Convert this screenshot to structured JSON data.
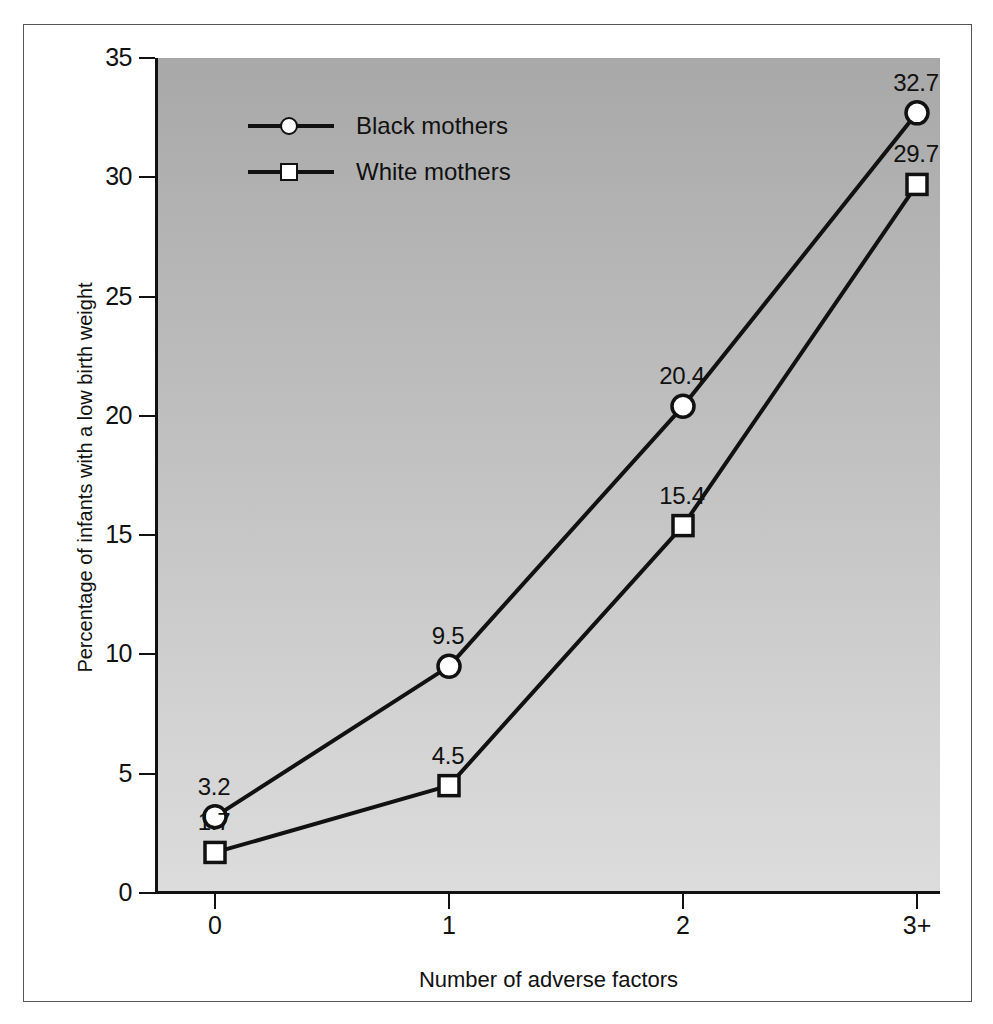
{
  "chart_data": {
    "type": "line",
    "title": "",
    "xlabel": "Number of adverse factors",
    "ylabel": "Percentage of infants with a low birth weight",
    "categories": [
      "0",
      "1",
      "2",
      "3+"
    ],
    "ylim": [
      0,
      35
    ],
    "yticks": [
      "0",
      "5",
      "10",
      "15",
      "20",
      "25",
      "30",
      "35"
    ],
    "grid": false,
    "legend_position": "top-left-inside",
    "series": [
      {
        "name": "Black mothers",
        "marker": "circle",
        "values": [
          3.2,
          9.5,
          20.4,
          32.7
        ],
        "labels": [
          "3.2",
          "9.5",
          "20.4",
          "32.7"
        ]
      },
      {
        "name": "White mothers",
        "marker": "square",
        "values": [
          1.7,
          4.5,
          15.4,
          29.7
        ],
        "labels": [
          "1.7",
          "4.5",
          "15.4",
          "29.7"
        ]
      }
    ]
  },
  "legend": {
    "items": [
      {
        "label": "Black mothers",
        "marker": "circle"
      },
      {
        "label": "White mothers",
        "marker": "square"
      }
    ]
  },
  "colors": {
    "line": "#111111",
    "marker_fill": "#ffffff",
    "plot_bg_top": "#a8a8a8",
    "plot_bg_bottom": "#dcdcdc",
    "frame": "#555555",
    "text": "#111111"
  }
}
